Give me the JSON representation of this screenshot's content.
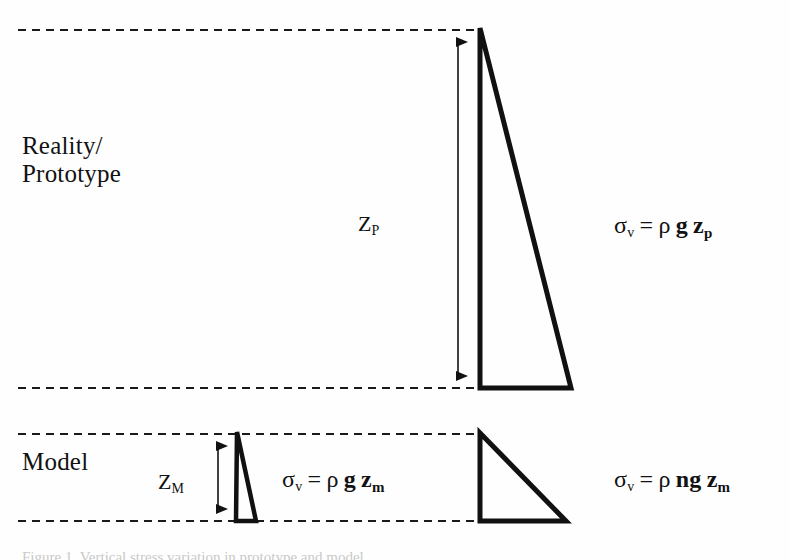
{
  "figure": {
    "type": "technical-diagram",
    "background_color": "#fefefe",
    "ink_color": "#121212"
  },
  "sections": {
    "prototype": {
      "label": "Reality/\nPrototype",
      "label_line1": "Reality/",
      "label_line2": "Prototype",
      "depth_symbol": "Z",
      "depth_subscript": "P",
      "equation": {
        "lhs_symbol": "σ",
        "lhs_subscript": "v",
        "operator": "=",
        "density": "ρ",
        "gravity": "g",
        "depth": "z",
        "depth_subscript": "p"
      }
    },
    "model": {
      "label": "Model",
      "depth_symbol": "Z",
      "depth_subscript": "M",
      "equation_left": {
        "lhs_symbol": "σ",
        "lhs_subscript": "v",
        "operator": "=",
        "density": "ρ",
        "gravity": "g",
        "depth": "z",
        "depth_subscript": "m"
      },
      "equation_right": {
        "lhs_symbol": "σ",
        "lhs_subscript": "v",
        "operator": "=",
        "density": "ρ",
        "gravity": "ng",
        "depth": "z",
        "depth_subscript": "m"
      }
    }
  },
  "caption": {
    "text": "Figure 1. Vertical stress variation in prototype and model"
  },
  "geometry": {
    "dashed_lines": [
      {
        "name": "prototype-top",
        "x1": 18,
        "x2": 478,
        "y": 30
      },
      {
        "name": "prototype-base",
        "x1": 18,
        "x2": 482,
        "y": 388
      },
      {
        "name": "model-top",
        "x1": 18,
        "x2": 478,
        "y": 434
      },
      {
        "name": "model-base",
        "x1": 18,
        "x2": 568,
        "y": 521
      }
    ],
    "triangles": [
      {
        "name": "prototype-stress-triangle",
        "apex_x": 480,
        "apex_y": 28,
        "base_y": 388,
        "base_right_x": 571
      },
      {
        "name": "model-stress-triangle-1g",
        "apex_x": 237,
        "apex_y": 432,
        "base_y": 521,
        "base_right_x": 256
      },
      {
        "name": "model-stress-triangle-ng",
        "apex_x": 480,
        "apex_y": 433,
        "base_y": 521,
        "base_right_x": 566
      }
    ],
    "arrows": [
      {
        "name": "prototype-depth-arrow",
        "x": 458,
        "y_top": 30,
        "y_bottom": 388,
        "heads": "both"
      },
      {
        "name": "model-depth-arrow",
        "x": 218,
        "y_top": 434,
        "y_bottom": 521,
        "heads": "both"
      }
    ]
  }
}
